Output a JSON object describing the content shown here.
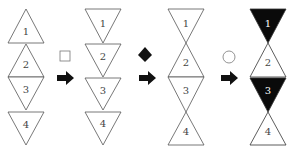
{
  "columns": [
    {
      "triangles": [
        {
          "label": "1",
          "dir": "up",
          "fill": "white"
        },
        {
          "label": "2",
          "dir": "up",
          "fill": "white"
        },
        {
          "label": "3",
          "dir": "down",
          "fill": "white"
        },
        {
          "label": "4",
          "dir": "down",
          "fill": "white"
        }
      ]
    },
    {
      "triangles": [
        {
          "label": "1",
          "dir": "down",
          "fill": "white"
        },
        {
          "label": "2",
          "dir": "down",
          "fill": "white"
        },
        {
          "label": "3",
          "dir": "down",
          "fill": "white"
        },
        {
          "label": "4",
          "dir": "down",
          "fill": "white"
        }
      ]
    },
    {
      "triangles": [
        {
          "label": "1",
          "dir": "down",
          "fill": "white"
        },
        {
          "label": "2",
          "dir": "up",
          "fill": "white"
        },
        {
          "label": "3",
          "dir": "down",
          "fill": "white"
        },
        {
          "label": "4",
          "dir": "up",
          "fill": "white"
        }
      ]
    },
    {
      "triangles": [
        {
          "label": "1",
          "dir": "down",
          "fill": "black"
        },
        {
          "label": "2",
          "dir": "up",
          "fill": "white"
        },
        {
          "label": "3",
          "dir": "down",
          "fill": "black"
        },
        {
          "label": "4",
          "dir": "up",
          "fill": "white"
        }
      ]
    }
  ],
  "operators": [
    {
      "symbol": "square",
      "style": "white"
    },
    {
      "symbol": "diamond",
      "style": "black"
    },
    {
      "symbol": "circle",
      "style": "white"
    }
  ],
  "labels": {
    "c1": [
      "1",
      "2",
      "3",
      "4"
    ],
    "c2": [
      "1",
      "2",
      "3",
      "4"
    ],
    "c3": [
      "1",
      "2",
      "3",
      "4"
    ],
    "c4": [
      "1",
      "2",
      "3",
      "4"
    ]
  }
}
